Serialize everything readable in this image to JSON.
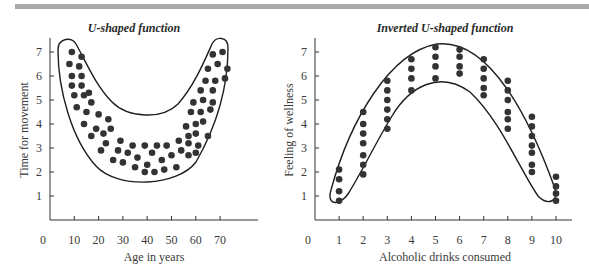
{
  "page": {
    "header_rule_color": "#a9a9a9",
    "dot_color": "#333333",
    "line_color": "#1e1e1e"
  },
  "chart_data": [
    {
      "type": "scatter",
      "title": "U-shaped function",
      "xlabel": "Age in years",
      "ylabel": "Time for movement",
      "xlim": [
        0,
        85
      ],
      "ylim": [
        0,
        7.5
      ],
      "x_ticks": [
        "0",
        "10",
        "20",
        "30",
        "40",
        "50",
        "60",
        "70"
      ],
      "y_ticks": [
        "1",
        "2",
        "3",
        "4",
        "5",
        "6",
        "7"
      ],
      "grid": false,
      "legend": null,
      "annotation": "Closed U-shaped envelope enclosing the points",
      "points": [
        [
          9,
          7.0
        ],
        [
          13,
          6.8
        ],
        [
          8,
          6.5
        ],
        [
          12,
          6.4
        ],
        [
          9,
          6.0
        ],
        [
          13,
          6.0
        ],
        [
          9,
          5.6
        ],
        [
          13,
          5.6
        ],
        [
          16,
          5.3
        ],
        [
          10,
          5.2
        ],
        [
          14,
          5.2
        ],
        [
          17,
          4.9
        ],
        [
          11,
          4.7
        ],
        [
          15,
          4.5
        ],
        [
          20,
          4.4
        ],
        [
          24,
          4.2
        ],
        [
          14,
          4.0
        ],
        [
          19,
          3.8
        ],
        [
          25,
          3.8
        ],
        [
          22,
          3.6
        ],
        [
          17,
          3.5
        ],
        [
          23,
          3.2
        ],
        [
          29,
          3.3
        ],
        [
          34,
          3.1
        ],
        [
          39,
          3.1
        ],
        [
          44,
          3.1
        ],
        [
          48,
          3.1
        ],
        [
          21,
          2.9
        ],
        [
          28,
          2.9
        ],
        [
          32,
          2.8
        ],
        [
          42,
          2.8
        ],
        [
          53,
          3.3
        ],
        [
          57,
          3.5
        ],
        [
          60,
          3.6
        ],
        [
          26,
          2.5
        ],
        [
          30,
          2.4
        ],
        [
          36,
          2.6
        ],
        [
          46,
          2.5
        ],
        [
          50,
          2.7
        ],
        [
          54,
          2.9
        ],
        [
          57,
          3.2
        ],
        [
          61,
          3.1
        ],
        [
          35,
          2.2
        ],
        [
          40,
          2.3
        ],
        [
          52,
          2.2
        ],
        [
          57,
          2.7
        ],
        [
          60,
          2.8
        ],
        [
          39,
          2.0
        ],
        [
          43,
          2.0
        ],
        [
          47,
          2.1
        ],
        [
          65,
          3.5
        ],
        [
          56,
          3.9
        ],
        [
          60,
          4.0
        ],
        [
          63,
          4.1
        ],
        [
          58,
          4.5
        ],
        [
          62,
          4.5
        ],
        [
          66,
          4.6
        ],
        [
          59,
          4.9
        ],
        [
          63,
          5.0
        ],
        [
          67,
          4.9
        ],
        [
          62,
          5.4
        ],
        [
          67,
          5.4
        ],
        [
          64,
          5.8
        ],
        [
          68,
          5.8
        ],
        [
          72,
          5.9
        ],
        [
          65,
          6.3
        ],
        [
          69,
          6.5
        ],
        [
          73,
          6.3
        ],
        [
          67,
          6.9
        ],
        [
          71,
          7.0
        ]
      ]
    },
    {
      "type": "scatter",
      "title": "Inverted U-shaped function",
      "xlabel": "Alcoholic drinks consumed",
      "ylabel": "Feeling of wellness",
      "xlim": [
        0,
        10.5
      ],
      "ylim": [
        0,
        7.5
      ],
      "x_ticks": [
        "0",
        "1",
        "2",
        "3",
        "4",
        "5",
        "6",
        "7",
        "8",
        "9",
        "10"
      ],
      "y_ticks": [
        "1",
        "2",
        "3",
        "4",
        "5",
        "6",
        "7"
      ],
      "grid": false,
      "legend": null,
      "annotation": "Closed inverted-U envelope enclosing the points",
      "points": [
        [
          1,
          2.1
        ],
        [
          1,
          1.7
        ],
        [
          1,
          1.2
        ],
        [
          1,
          0.8
        ],
        [
          2,
          4.5
        ],
        [
          2,
          4.0
        ],
        [
          2,
          3.6
        ],
        [
          2,
          3.2
        ],
        [
          2,
          2.7
        ],
        [
          2,
          2.3
        ],
        [
          2,
          1.9
        ],
        [
          3,
          5.8
        ],
        [
          3,
          5.4
        ],
        [
          3,
          5.0
        ],
        [
          3,
          4.6
        ],
        [
          3,
          4.2
        ],
        [
          3,
          3.8
        ],
        [
          4,
          6.7
        ],
        [
          4,
          6.3
        ],
        [
          4,
          5.9
        ],
        [
          4,
          5.4
        ],
        [
          5,
          7.2
        ],
        [
          5,
          6.8
        ],
        [
          5,
          6.4
        ],
        [
          5,
          5.9
        ],
        [
          6,
          7.1
        ],
        [
          6,
          6.8
        ],
        [
          6,
          6.4
        ],
        [
          6,
          6.1
        ],
        [
          7,
          6.7
        ],
        [
          7,
          6.3
        ],
        [
          7,
          5.9
        ],
        [
          7,
          5.5
        ],
        [
          7,
          5.2
        ],
        [
          8,
          5.8
        ],
        [
          8,
          5.4
        ],
        [
          8,
          5.0
        ],
        [
          8,
          4.5
        ],
        [
          8,
          4.2
        ],
        [
          8,
          3.8
        ],
        [
          9,
          4.3
        ],
        [
          9,
          3.9
        ],
        [
          9,
          3.5
        ],
        [
          9,
          3.1
        ],
        [
          9,
          2.8
        ],
        [
          9,
          2.3
        ],
        [
          9,
          2.0
        ],
        [
          10,
          1.8
        ],
        [
          10,
          1.4
        ],
        [
          10,
          1.1
        ],
        [
          10,
          0.8
        ]
      ]
    }
  ]
}
